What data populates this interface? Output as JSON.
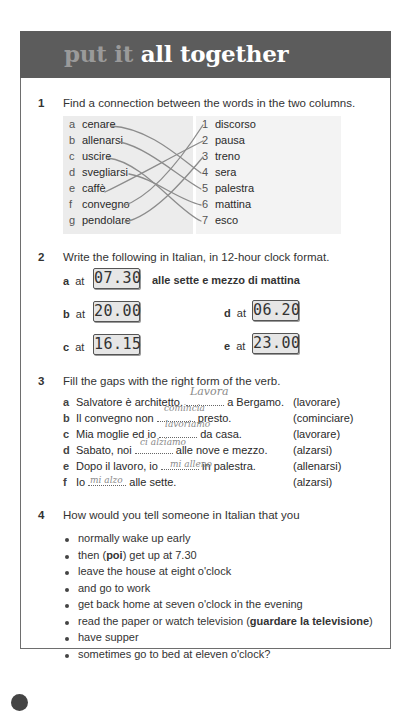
{
  "header": {
    "title_part1": "put it",
    "title_part2": "all together"
  },
  "exercise1": {
    "number": "1",
    "instruction": "Find a connection between the words in the two columns.",
    "left": [
      {
        "letter": "a",
        "word": "cenare"
      },
      {
        "letter": "b",
        "word": "allenarsi"
      },
      {
        "letter": "c",
        "word": "uscire"
      },
      {
        "letter": "d",
        "word": "svegliarsi"
      },
      {
        "letter": "e",
        "word": "caffè"
      },
      {
        "letter": "f",
        "word": "convegno"
      },
      {
        "letter": "g",
        "word": "pendolare"
      }
    ],
    "right": [
      {
        "letter": "1",
        "word": "discorso"
      },
      {
        "letter": "2",
        "word": "pausa"
      },
      {
        "letter": "3",
        "word": "treno"
      },
      {
        "letter": "4",
        "word": "sera"
      },
      {
        "letter": "5",
        "word": "palestra"
      },
      {
        "letter": "6",
        "word": "mattina"
      },
      {
        "letter": "7",
        "word": "esco"
      }
    ],
    "connections": [
      [
        "a",
        "4"
      ],
      [
        "b",
        "5"
      ],
      [
        "c",
        "7"
      ],
      [
        "d",
        "6"
      ],
      [
        "e",
        "2"
      ],
      [
        "f",
        "1"
      ],
      [
        "g",
        "3"
      ]
    ]
  },
  "exercise2": {
    "number": "2",
    "instruction": "Write the following in Italian, in 12-hour clock format.",
    "at_label": "at",
    "items": [
      {
        "letter": "a",
        "time": "07.30",
        "answer": "alle sette e mezzo di mattina"
      },
      {
        "letter": "b",
        "time": "20.00",
        "answer": ""
      },
      {
        "letter": "c",
        "time": "16.15",
        "answer": ""
      },
      {
        "letter": "d",
        "time": "06.20",
        "answer": ""
      },
      {
        "letter": "e",
        "time": "23.00",
        "answer": ""
      }
    ]
  },
  "exercise3": {
    "number": "3",
    "instruction": "Fill the gaps with the right form of the verb.",
    "items": [
      {
        "letter": "a",
        "before": "Salvatore è architetto.",
        "handwritten": "Lavora",
        "after": "a Bergamo.",
        "verb": "(lavorare)"
      },
      {
        "letter": "b",
        "before": "Il convegno non",
        "handwritten": "comincia",
        "after": "presto.",
        "verb": "(cominciare)"
      },
      {
        "letter": "c",
        "before": "Mia moglie ed io",
        "handwritten": "lavoriamo",
        "after": "da casa.",
        "verb": "(lavorare)"
      },
      {
        "letter": "d",
        "before": "Sabato, noi",
        "handwritten": "ci alziamo",
        "after": "alle nove e mezzo.",
        "verb": "(alzarsi)"
      },
      {
        "letter": "e",
        "before": "Dopo il lavoro, io",
        "handwritten": "mi alleno",
        "after": "in palestra.",
        "verb": "(allenarsi)"
      },
      {
        "letter": "f",
        "before": "Io",
        "handwritten": "mi alzo",
        "after": "alle sette.",
        "verb": "(alzarsi)"
      }
    ]
  },
  "exercise4": {
    "number": "4",
    "instruction": "How would you tell someone in Italian that you",
    "bullets": [
      {
        "pre": "normally wake up early",
        "bold": "",
        "post": ""
      },
      {
        "pre": "then (",
        "bold": "poi",
        "post": ") get up at 7.30"
      },
      {
        "pre": "leave the house at eight o'clock",
        "bold": "",
        "post": ""
      },
      {
        "pre": "and go to work",
        "bold": "",
        "post": ""
      },
      {
        "pre": "get back home at seven o'clock in the evening",
        "bold": "",
        "post": ""
      },
      {
        "pre": "read the paper or watch television (",
        "bold": "guardare la televisione",
        "post": ")"
      },
      {
        "pre": "have supper",
        "bold": "",
        "post": ""
      },
      {
        "pre": "sometimes go to bed at eleven o'clock?",
        "bold": "",
        "post": ""
      }
    ]
  }
}
